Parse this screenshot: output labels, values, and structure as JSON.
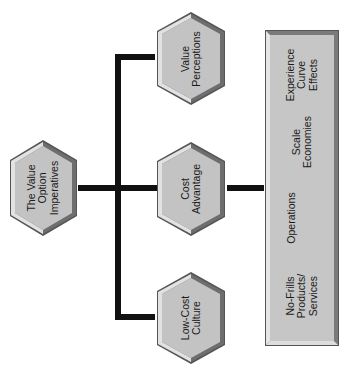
{
  "diagram": {
    "root": {
      "label": "The Value\nOption\nImperatives"
    },
    "branches": [
      {
        "label": "Value\nPerceptions"
      },
      {
        "label": "Cost\nAdvantage"
      },
      {
        "label": "Low-Cost\nCulture"
      }
    ],
    "detail_box": {
      "parent": "Cost Advantage",
      "items": [
        {
          "label": "Experience\nCurve\nEffects"
        },
        {
          "label": "Scale\nEconomies"
        },
        {
          "label": "Operations"
        },
        {
          "label": "No-Frills\nProducts/\nServices"
        }
      ]
    }
  },
  "colors": {
    "hex_fill": "#c3c3c3",
    "hex_light_bevel": "#e2e2e2",
    "hex_dark_bevel": "#6e6e6e",
    "hex_outline": "#555555",
    "connector": "#111111",
    "box_fill": "#c6c6c6"
  }
}
